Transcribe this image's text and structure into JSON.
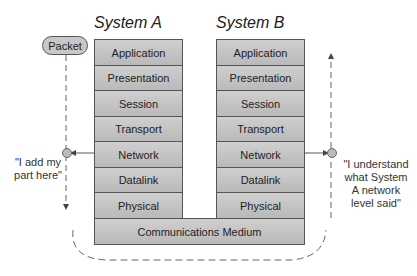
{
  "system_a": {
    "title": "System A",
    "layers": [
      "Application",
      "Presentation",
      "Session",
      "Transport",
      "Network",
      "Datalink",
      "Physical"
    ]
  },
  "system_b": {
    "title": "System B",
    "layers": [
      "Application",
      "Presentation",
      "Session",
      "Transport",
      "Network",
      "Datalink",
      "Physical"
    ]
  },
  "medium": {
    "label": "Communications Medium"
  },
  "packet": {
    "label": "Packet"
  },
  "notes": {
    "left_line1": "\"I add my",
    "left_line2": "part here\"",
    "right_line1": "\"I understand",
    "right_line2": "what System",
    "right_line3": "A network",
    "right_line4": "level said\""
  },
  "colors": {
    "layer_fill": "#c4c4c4",
    "border": "#555555",
    "dashed_line": "#666666"
  }
}
